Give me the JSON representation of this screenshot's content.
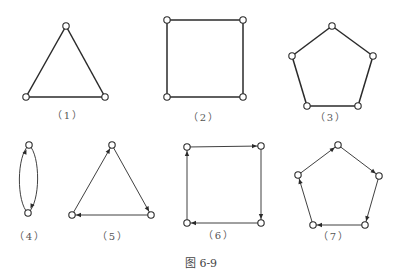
{
  "figure": {
    "caption": "图 6-9",
    "stroke_color": "#2a2a2a",
    "node_fill": "#ffffff",
    "node_radius": 3.2
  },
  "graphs": [
    {
      "id": "1",
      "label": "（1）",
      "directed": false,
      "shape": "triangle",
      "label_pos": [
        68,
        113
      ],
      "nodes": [
        [
          66,
          26
        ],
        [
          26,
          97
        ],
        [
          105,
          97
        ]
      ],
      "edges": [
        [
          0,
          1
        ],
        [
          1,
          2
        ],
        [
          2,
          0
        ]
      ],
      "stroke_width": 1.5
    },
    {
      "id": "2",
      "label": "（2）",
      "directed": false,
      "shape": "square",
      "label_pos": [
        204,
        115
      ],
      "nodes": [
        [
          167,
          20
        ],
        [
          243,
          20
        ],
        [
          243,
          97
        ],
        [
          167,
          97
        ]
      ],
      "edges": [
        [
          0,
          1
        ],
        [
          1,
          2
        ],
        [
          2,
          3
        ],
        [
          3,
          0
        ]
      ],
      "stroke_width": 1.5
    },
    {
      "id": "3",
      "label": "（3）",
      "directed": false,
      "shape": "pentagon",
      "label_pos": [
        331,
        115
      ],
      "nodes": [
        [
          332,
          26
        ],
        [
          373,
          56
        ],
        [
          358,
          106
        ],
        [
          307,
          106
        ],
        [
          292,
          56
        ]
      ],
      "edges": [
        [
          0,
          1
        ],
        [
          1,
          2
        ],
        [
          2,
          3
        ],
        [
          3,
          4
        ],
        [
          4,
          0
        ]
      ],
      "stroke_width": 1.5
    },
    {
      "id": "4",
      "label": "（4）",
      "directed": true,
      "shape": "two-cycle",
      "label_pos": [
        30,
        234
      ],
      "nodes": [
        [
          29,
          145
        ],
        [
          28,
          213
        ]
      ],
      "arcs": [
        {
          "from": 1,
          "to": 0,
          "side": "left"
        },
        {
          "from": 0,
          "to": 1,
          "side": "right"
        }
      ],
      "stroke_width": 0.9
    },
    {
      "id": "5",
      "label": "（5）",
      "directed": true,
      "shape": "triangle",
      "label_pos": [
        113,
        234
      ],
      "nodes": [
        [
          112,
          145
        ],
        [
          151,
          215
        ],
        [
          72,
          215
        ]
      ],
      "edges": [
        [
          2,
          0
        ],
        [
          0,
          1
        ],
        [
          1,
          2
        ]
      ],
      "stroke_width": 0.9
    },
    {
      "id": "6",
      "label": "（6）",
      "directed": true,
      "shape": "square",
      "label_pos": [
        219,
        233
      ],
      "nodes": [
        [
          187,
          147
        ],
        [
          261,
          146
        ],
        [
          261,
          223
        ],
        [
          187,
          223
        ]
      ],
      "edges": [
        [
          0,
          1
        ],
        [
          1,
          2
        ],
        [
          2,
          3
        ],
        [
          3,
          0
        ]
      ],
      "stroke_width": 0.9
    },
    {
      "id": "7",
      "label": "（7）",
      "directed": true,
      "shape": "pentagon",
      "label_pos": [
        334,
        234
      ],
      "nodes": [
        [
          338,
          145
        ],
        [
          379,
          176
        ],
        [
          365,
          225
        ],
        [
          313,
          225
        ],
        [
          298,
          175
        ]
      ],
      "edges": [
        [
          4,
          0
        ],
        [
          0,
          1
        ],
        [
          1,
          2
        ],
        [
          2,
          3
        ],
        [
          3,
          4
        ]
      ],
      "stroke_width": 0.9
    }
  ]
}
